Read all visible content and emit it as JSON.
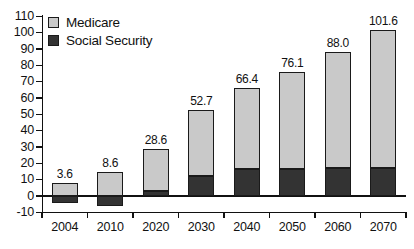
{
  "chart_data": {
    "type": "bar",
    "title": "",
    "subtitle": "",
    "xlabel": "",
    "ylabel": "",
    "stacked": true,
    "grid": false,
    "legend_position": "top-left",
    "categories": [
      "2004",
      "2010",
      "2020",
      "2030",
      "2040",
      "2050",
      "2060",
      "2070"
    ],
    "ylim": [
      -10,
      110
    ],
    "yticks": [
      -10,
      0,
      10,
      20,
      30,
      40,
      50,
      60,
      70,
      80,
      90,
      100,
      110
    ],
    "ytick_labels": [
      "-10",
      "0",
      "10",
      "20",
      "30",
      "40",
      "50",
      "60",
      "70",
      "80",
      "90",
      "100",
      "110"
    ],
    "series": [
      {
        "name": "Medicare",
        "color": "#c9c9c9",
        "values": [
          8.1,
          14.6,
          25.6,
          40.2,
          49.9,
          59.4,
          70.8,
          84.2
        ]
      },
      {
        "name": "Social Security",
        "color": "#333333",
        "values": [
          -4.5,
          -6.0,
          3.0,
          12.5,
          16.5,
          16.7,
          17.2,
          17.4
        ]
      }
    ],
    "totals": [
      3.6,
      8.6,
      28.6,
      52.7,
      66.4,
      76.1,
      88.0,
      101.6
    ],
    "total_labels": [
      "3.6",
      "8.6",
      "28.6",
      "52.7",
      "66.4",
      "76.1",
      "88.0",
      "101.6"
    ]
  },
  "legend": {
    "items": [
      {
        "label": "Medicare",
        "swatch": "medicare-swatch"
      },
      {
        "label": "Social Security",
        "swatch": "social-security-swatch"
      }
    ]
  }
}
